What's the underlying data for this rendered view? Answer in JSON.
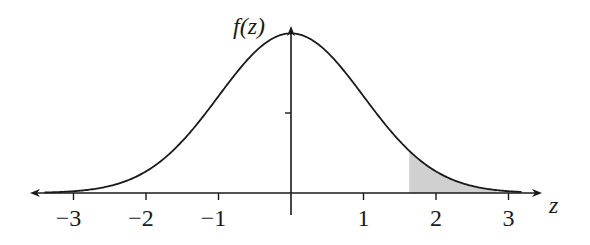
{
  "chart_data": {
    "type": "line",
    "title": "",
    "xlabel": "z",
    "ylabel": "f(z)",
    "function": "standard normal density f(z) = exp(-z^2/2)/sqrt(2*pi)",
    "x": [
      -3.5,
      -3,
      -2.5,
      -2,
      -1.5,
      -1,
      -0.5,
      0,
      0.5,
      1,
      1.5,
      2,
      2.5,
      3,
      3.3
    ],
    "values": [
      0.0009,
      0.0044,
      0.0175,
      0.054,
      0.1295,
      0.242,
      0.3521,
      0.3989,
      0.3521,
      0.242,
      0.1295,
      0.054,
      0.0175,
      0.0044,
      0.0017
    ],
    "xlim": [
      -3.5,
      3.35
    ],
    "ylim": [
      0,
      0.42
    ],
    "xticks": [
      -3,
      -2,
      -1,
      1,
      2,
      3
    ],
    "xtick_labels": [
      "−3",
      "−2",
      "−1",
      "1",
      "2",
      "3"
    ],
    "yticks": [
      0.2
    ],
    "shaded_region": {
      "from": 1.63,
      "to": 3.3,
      "color": "#d0d0d0",
      "meaning": "upper tail area"
    },
    "grid": false,
    "legend": null
  },
  "labels": {
    "y_axis": "f(z)",
    "x_axis": "z",
    "ticks": [
      "−3",
      "−2",
      "−1",
      "1",
      "2",
      "3"
    ]
  },
  "colors": {
    "curve": "#1a1a1a",
    "axis": "#1a1a1a",
    "shade": "#d0d0d0"
  }
}
